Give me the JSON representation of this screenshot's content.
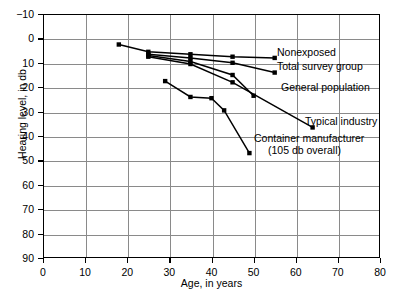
{
  "chart_data": {
    "type": "line",
    "title": "",
    "xlabel": "Age, in years",
    "ylabel": "Hearing level, in db",
    "xlim": [
      0,
      80
    ],
    "ylim": [
      -10,
      90
    ],
    "y_inverted": true,
    "grid": true,
    "legend_position": "inline-right-of-series",
    "xticks": [
      "0",
      "10",
      "20",
      "30",
      "40",
      "50",
      "60",
      "70",
      "80"
    ],
    "yticks": [
      "−10",
      "0",
      "10",
      "20",
      "30",
      "40",
      "50",
      "60",
      "70",
      "80",
      "90"
    ],
    "xtick_values": [
      0,
      10,
      20,
      30,
      40,
      50,
      60,
      70,
      80
    ],
    "ytick_values": [
      -10,
      0,
      10,
      20,
      30,
      40,
      50,
      60,
      70,
      80,
      90
    ],
    "series": [
      {
        "name": "Nonexposed",
        "label": "Nonexposed",
        "label_sub": "",
        "color": "#000000",
        "points": [
          {
            "x": 18,
            "y": 2.5
          },
          {
            "x": 25,
            "y": 5.5
          },
          {
            "x": 35,
            "y": 6.5
          },
          {
            "x": 45,
            "y": 7.5
          },
          {
            "x": 55,
            "y": 8.0
          }
        ]
      },
      {
        "name": "Total survey group",
        "label": "Total survey group",
        "label_sub": "",
        "color": "#000000",
        "points": [
          {
            "x": 25,
            "y": 6.5
          },
          {
            "x": 35,
            "y": 8.0
          },
          {
            "x": 45,
            "y": 10.0
          },
          {
            "x": 55,
            "y": 14.0
          }
        ]
      },
      {
        "name": "General population",
        "label": "General population",
        "label_sub": "",
        "color": "#000000",
        "points": [
          {
            "x": 25,
            "y": 7.0
          },
          {
            "x": 35,
            "y": 9.5
          },
          {
            "x": 45,
            "y": 15.0
          },
          {
            "x": 50,
            "y": 23.5
          }
        ]
      },
      {
        "name": "Typical industry",
        "label": "Typical industry",
        "label_sub": "",
        "color": "#000000",
        "points": [
          {
            "x": 25,
            "y": 7.5
          },
          {
            "x": 35,
            "y": 10.5
          },
          {
            "x": 45,
            "y": 18.0
          },
          {
            "x": 64,
            "y": 36.5
          }
        ]
      },
      {
        "name": "Container manufacturer",
        "label": "Container manufacturer",
        "label_sub": "(105 db overall)",
        "color": "#000000",
        "points": [
          {
            "x": 29,
            "y": 17.5
          },
          {
            "x": 35,
            "y": 24.0
          },
          {
            "x": 40,
            "y": 24.5
          },
          {
            "x": 43,
            "y": 29.5
          },
          {
            "x": 49,
            "y": 47.0
          }
        ]
      }
    ],
    "series_labels": [
      {
        "name": "Nonexposed",
        "text": "Nonexposed",
        "sub": "",
        "x_px": 277,
        "y_px": 52
      },
      {
        "name": "Total survey group",
        "text": "Total survey group",
        "sub": "",
        "x_px": 277,
        "y_px": 66
      },
      {
        "name": "General population",
        "text": "General population",
        "sub": "",
        "x_px": 281,
        "y_px": 87
      },
      {
        "name": "Typical industry",
        "text": "Typical industry",
        "sub": "",
        "x_px": 305,
        "y_px": 121
      },
      {
        "name": "Container manufacturer",
        "text": "Container manufacturer",
        "sub": "(105 db overall)",
        "x_px": 254,
        "y_px": 138
      }
    ]
  }
}
